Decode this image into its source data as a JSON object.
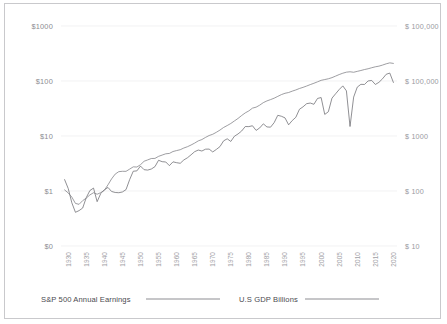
{
  "chart_data": {
    "type": "line",
    "title": "",
    "xlabel": "",
    "ylabel": "",
    "grid": true,
    "legend_position": "bottom",
    "x_ticks": [
      "1930",
      "1935",
      "1940",
      "1945",
      "1950",
      "1955",
      "1960",
      "1965",
      "1970",
      "1975",
      "1980",
      "1985",
      "1990",
      "1995",
      "2000",
      "2005",
      "2010",
      "2015",
      "2020"
    ],
    "xlim": [
      1928,
      2021
    ],
    "y_left_axis": {
      "scale": "log",
      "ticks": [
        "$1000",
        "$100",
        "$10",
        "$1",
        "$0"
      ],
      "tick_values": [
        1000,
        100,
        10,
        1,
        0.1
      ],
      "ylim": [
        0.1,
        1000
      ]
    },
    "y_right_axis": {
      "scale": "log",
      "ticks": [
        "$ 100,000",
        "$ 100,000",
        "$ 1000",
        "$ 100",
        "$ 10"
      ],
      "tick_values": [
        100000,
        10000,
        1000,
        100,
        10
      ],
      "ylim": [
        10,
        100000
      ]
    },
    "series": [
      {
        "name": "S&P 500 Annual Earnings",
        "color": "#6b6b70",
        "axis": "left",
        "x": [
          1929,
          1930,
          1931,
          1932,
          1933,
          1934,
          1935,
          1936,
          1937,
          1938,
          1939,
          1940,
          1941,
          1942,
          1943,
          1944,
          1945,
          1946,
          1947,
          1948,
          1949,
          1950,
          1951,
          1952,
          1953,
          1954,
          1955,
          1956,
          1957,
          1958,
          1959,
          1960,
          1961,
          1962,
          1963,
          1964,
          1965,
          1966,
          1967,
          1968,
          1969,
          1970,
          1971,
          1972,
          1973,
          1974,
          1975,
          1976,
          1977,
          1978,
          1979,
          1980,
          1981,
          1982,
          1983,
          1984,
          1985,
          1986,
          1987,
          1988,
          1989,
          1990,
          1991,
          1992,
          1993,
          1994,
          1995,
          1996,
          1997,
          1998,
          1999,
          2000,
          2001,
          2002,
          2003,
          2004,
          2005,
          2006,
          2007,
          2008,
          2009,
          2010,
          2011,
          2012,
          2013,
          2014,
          2015,
          2016,
          2017,
          2018,
          2019,
          2020
        ],
        "y": [
          1.61,
          1.11,
          0.61,
          0.41,
          0.44,
          0.49,
          0.76,
          1.02,
          1.13,
          0.64,
          0.9,
          1.05,
          1.16,
          0.98,
          0.94,
          0.93,
          0.96,
          1.06,
          1.61,
          2.29,
          2.32,
          2.84,
          2.44,
          2.4,
          2.51,
          2.77,
          3.62,
          3.41,
          3.37,
          2.89,
          3.39,
          3.27,
          3.19,
          3.67,
          4.02,
          4.55,
          5.19,
          5.55,
          5.33,
          5.76,
          5.78,
          5.13,
          5.7,
          6.42,
          8.16,
          8.89,
          7.96,
          9.91,
          10.89,
          12.33,
          14.86,
          14.82,
          15.36,
          12.64,
          14.03,
          16.64,
          14.61,
          14.48,
          17.5,
          23.75,
          22.87,
          21.34,
          15.97,
          19.09,
          21.89,
          30.6,
          33.96,
          38.73,
          39.72,
          37.71,
          48.17,
          50.0,
          24.69,
          27.59,
          48.74,
          58.55,
          69.93,
          81.51,
          66.18,
          14.88,
          50.97,
          77.35,
          86.95,
          86.51,
          100.2,
          102.31,
          86.53,
          94.55,
          109.88,
          132.39,
          139.47,
          94.14
        ]
      },
      {
        "name": "U.S GDP Billions",
        "color": "#7e7e83",
        "axis": "right",
        "x": [
          1929,
          1930,
          1931,
          1932,
          1933,
          1934,
          1935,
          1936,
          1937,
          1938,
          1939,
          1940,
          1941,
          1942,
          1943,
          1944,
          1945,
          1946,
          1947,
          1948,
          1949,
          1950,
          1951,
          1952,
          1953,
          1954,
          1955,
          1956,
          1957,
          1958,
          1959,
          1960,
          1961,
          1962,
          1963,
          1964,
          1965,
          1966,
          1967,
          1968,
          1969,
          1970,
          1971,
          1972,
          1973,
          1974,
          1975,
          1976,
          1977,
          1978,
          1979,
          1980,
          1981,
          1982,
          1983,
          1984,
          1985,
          1986,
          1987,
          1988,
          1989,
          1990,
          1991,
          1992,
          1993,
          1994,
          1995,
          1996,
          1997,
          1998,
          1999,
          2000,
          2001,
          2002,
          2003,
          2004,
          2005,
          2006,
          2007,
          2008,
          2009,
          2010,
          2011,
          2012,
          2013,
          2014,
          2015,
          2016,
          2017,
          2018,
          2019,
          2020
        ],
        "y": [
          104.6,
          92.2,
          77.4,
          59.5,
          57.2,
          66.8,
          74.3,
          84.9,
          93.0,
          87.4,
          93.5,
          102.9,
          129.4,
          166.0,
          203.1,
          224.6,
          228.2,
          227.8,
          249.9,
          274.8,
          272.8,
          300.2,
          347.3,
          367.7,
          389.7,
          391.1,
          426.2,
          450.1,
          474.9,
          482.0,
          522.5,
          543.3,
          563.3,
          605.1,
          638.6,
          685.8,
          743.7,
          815.0,
          861.7,
          942.5,
          1019.9,
          1075.9,
          1167.8,
          1282.4,
          1428.5,
          1548.8,
          1688.9,
          1877.6,
          2086.0,
          2356.6,
          2632.1,
          2862.5,
          3211.0,
          3345.0,
          3638.1,
          4040.7,
          4346.7,
          4590.2,
          4870.2,
          5252.6,
          5657.7,
          5979.6,
          6174.0,
          6539.3,
          6878.7,
          7308.8,
          7664.1,
          8100.2,
          8608.5,
          9089.2,
          9660.6,
          10284.8,
          10621.8,
          10977.5,
          11510.7,
          12274.9,
          13093.7,
          13855.9,
          14477.6,
          14718.6,
          14418.7,
          14964.4,
          15517.9,
          16155.3,
          16691.5,
          17427.6,
          18120.7,
          18624.5,
          19485.4,
          20527.2,
          21372.6,
          20893.7
        ]
      }
    ]
  },
  "legend": {
    "items": [
      {
        "label": "S&P 500 Annual Earnings",
        "color": "#8d8d92"
      },
      {
        "label": "U.S GDP Billions",
        "color": "#8d8d92"
      }
    ]
  }
}
